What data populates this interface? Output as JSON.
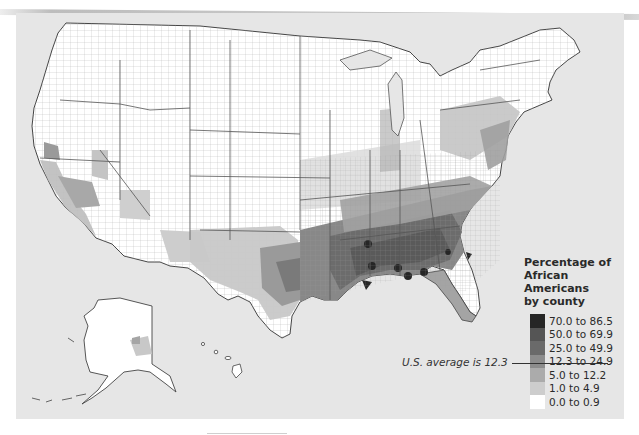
{
  "map": {
    "subject": "Percentage of African Americans by county",
    "region": "United States (contiguous states, Alaska, Hawaii)",
    "background_color": "#e6e6e6"
  },
  "legend": {
    "title_line1": "Percentage of",
    "title_line2": "African Americans",
    "title_line3": "by county",
    "classes": [
      {
        "label": "70.0 to 86.5",
        "color": "#262626"
      },
      {
        "label": "50.0 to 69.9",
        "color": "#555555"
      },
      {
        "label": "25.0 to 49.9",
        "color": "#6a6a6a"
      },
      {
        "label": "12.3 to 24.9",
        "color": "#8c8c8c"
      },
      {
        "label": "5.0 to 12.2",
        "color": "#ababab"
      },
      {
        "label": "1.0 to 4.9",
        "color": "#cdcdcd"
      },
      {
        "label": "0.0 to 0.9",
        "color": "#ffffff"
      }
    ]
  },
  "annotation": {
    "us_average": "U.S. average is 12.3"
  }
}
